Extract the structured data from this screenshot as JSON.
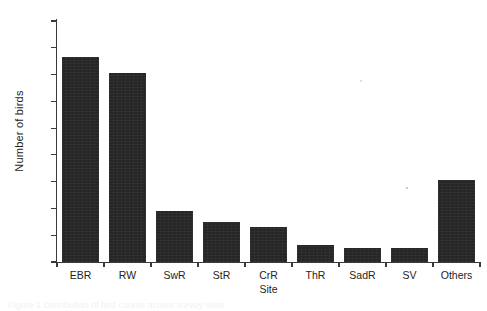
{
  "figure": {
    "background_color": "#ffffff",
    "bar_color": "#262626",
    "axis_color": "#3a3a3a",
    "text_color": "#242424",
    "caption_ghost": "Figure 1  Distribution of bird counts across survey sites"
  },
  "chart_data": {
    "type": "bar",
    "title": "",
    "xlabel": "Site",
    "ylabel": "Number of birds",
    "categories": [
      "EBR",
      "RW",
      "SwR",
      "StR",
      "CrR",
      "ThR",
      "SadR",
      "SV",
      "Others"
    ],
    "values": [
      1530,
      1415,
      382,
      298,
      265,
      128,
      108,
      105,
      615
    ],
    "ylim": [
      0,
      1800
    ],
    "yticks": [
      0,
      200,
      400,
      600,
      800,
      1000,
      1200,
      1400,
      1600,
      1800
    ],
    "ytick_labels": [
      "0",
      "200",
      "400",
      "600",
      "800",
      "1000",
      "1200",
      "1400",
      "1600",
      "1800"
    ],
    "grid": false,
    "legend": null,
    "series": [
      {
        "name": "Number of birds",
        "values": [
          1530,
          1415,
          382,
          298,
          265,
          128,
          108,
          105,
          615
        ]
      }
    ]
  }
}
